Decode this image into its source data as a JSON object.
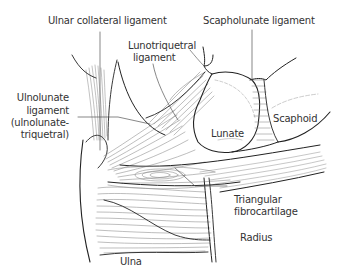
{
  "diagram": {
    "type": "anatomical-illustration",
    "line_color": "#222222",
    "hatch_color": "#888888",
    "labels": {
      "ulnar_collateral": "Ulnar collateral ligament",
      "lunotriquetral_1": "Lunotriquetral",
      "lunotriquetral_2": "ligament",
      "scapholunate": "Scapholunate ligament",
      "ulnolunate_1": "Ulnolunate",
      "ulnolunate_2": "ligament",
      "ulnolunate_3": "(ulnolunate-",
      "ulnolunate_4": "triquetral)",
      "lunate": "Lunate",
      "scaphoid": "Scaphoid",
      "tfc_1": "Triangular",
      "tfc_2": "fibrocartilage",
      "radius": "Radius",
      "ulna": "Ulna"
    }
  }
}
